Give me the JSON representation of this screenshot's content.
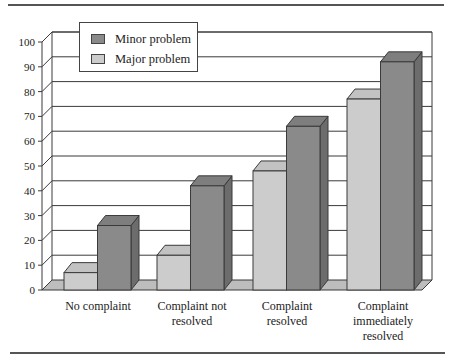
{
  "chart_data": {
    "type": "bar",
    "style": "3d-clustered-column",
    "title": "",
    "xlabel": "",
    "ylabel": "",
    "ylim": [
      0,
      100
    ],
    "yticks": [
      0,
      10,
      20,
      30,
      40,
      50,
      60,
      70,
      80,
      90,
      100
    ],
    "grid": true,
    "legend_position": "top-left (inside plot)",
    "categories": [
      "No complaint",
      "Complaint not\nresolved",
      "Complaint\nresolved",
      "Complaint\nimmediately\nresolved"
    ],
    "series": [
      {
        "name": "Major problem",
        "values": [
          7,
          14,
          48,
          77
        ],
        "color": "#cccccc"
      },
      {
        "name": "Minor problem",
        "values": [
          26,
          42,
          66,
          92
        ],
        "color": "#8a8a8a"
      }
    ]
  },
  "legend": {
    "items": [
      {
        "label": "Minor problem",
        "color": "#8a8a8a"
      },
      {
        "label": "Major problem",
        "color": "#cccccc"
      }
    ]
  },
  "colors": {
    "minor_front": "#8a8a8a",
    "minor_top": "#7e7e7e",
    "minor_side": "#6c6c6c",
    "major_front": "#cccccc",
    "major_top": "#c2c2c2",
    "major_side": "#a8a8a8",
    "floor": "#bdbdbd",
    "edge": "#3a3a3a"
  }
}
